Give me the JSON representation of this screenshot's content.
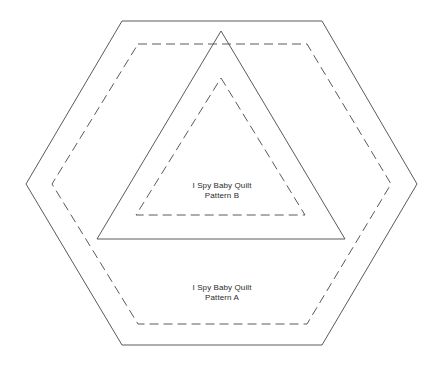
{
  "canvas": {
    "width": 444,
    "height": 368,
    "background_color": "#ffffff",
    "stroke_color": "#5a5a5a",
    "text_color": "#2b2b2b"
  },
  "shapes": [
    {
      "name": "outer-hexagon-solid",
      "type": "hexagon",
      "line_style": "solid",
      "points": "122,21 322,21 417,184 322,345 122,345 26,184"
    },
    {
      "name": "inner-hexagon-dashed",
      "type": "hexagon",
      "line_style": "dashed",
      "points": "138,44 307,44 391,184 307,324 138,324 52,184"
    },
    {
      "name": "outer-triangle-solid",
      "type": "triangle",
      "line_style": "solid",
      "points": "221,31 345,239 97,239"
    },
    {
      "name": "inner-triangle-dashed",
      "type": "triangle",
      "line_style": "dashed",
      "points": "221,78 305,215 136,215"
    }
  ],
  "labels": {
    "pattern_b": {
      "line1": "I Spy Baby Quilt",
      "line2": "Pattern B"
    },
    "pattern_a": {
      "line1": "I Spy Baby Quilt",
      "line2": "Pattern A"
    }
  }
}
